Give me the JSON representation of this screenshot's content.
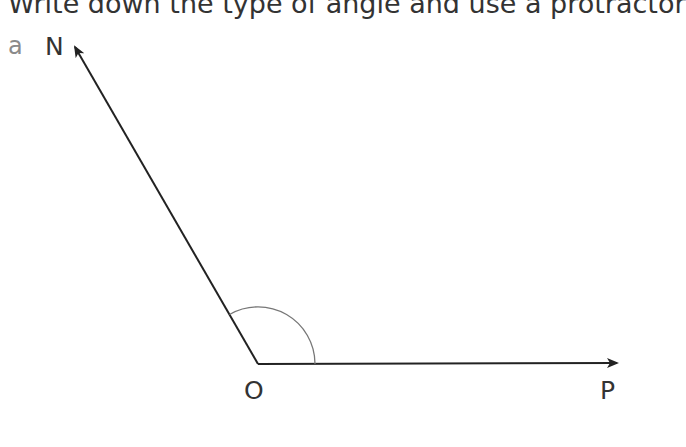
{
  "instruction": "Write down the type of angle and use a protractor",
  "question_label": "a",
  "points": {
    "N": {
      "label": "N",
      "x": 74,
      "y": 45
    },
    "O": {
      "label": "O",
      "x": 258,
      "y": 364
    },
    "P": {
      "label": "P",
      "x": 617,
      "y": 363
    }
  },
  "angle": {
    "vertex": "O",
    "rays": [
      "ON",
      "OP"
    ],
    "type": "obtuse",
    "marked": true
  },
  "colors": {
    "line": "#222222",
    "arc": "#777777",
    "label": "#333333",
    "question_label": "#8a8a8a"
  }
}
